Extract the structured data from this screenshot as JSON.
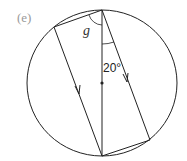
{
  "figure": {
    "part_label": "(e)",
    "unknown_angle_label": "g",
    "given_angle_label": "20°",
    "circle": {
      "cx": 102,
      "cy": 83,
      "rx": 75,
      "ry": 73
    },
    "points": {
      "top": [
        102,
        10
      ],
      "bottom": [
        102,
        156
      ],
      "upper_left": [
        54,
        27
      ],
      "lower_right": [
        150,
        140
      ],
      "center": [
        102,
        83
      ]
    },
    "colors": {
      "line": "#222222",
      "part_label": "#9a9a9a"
    }
  }
}
